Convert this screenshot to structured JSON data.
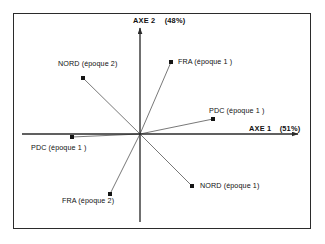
{
  "chart_data": {
    "type": "scatter",
    "title": "",
    "subtitle": "",
    "xlabel": "AXE 1",
    "ylabel": "AXE 2",
    "xlabel_full": "AXE 1  (51%)",
    "ylabel_full": "AXE 2   (48%)",
    "x_variance_pct": "(51%)",
    "y_variance_pct": "(48%)",
    "grid": false,
    "legend": "none",
    "origin": {
      "x": 140,
      "y": 134
    },
    "xlim": [
      -1.0,
      1.0
    ],
    "ylim": [
      -1.0,
      1.0
    ],
    "points": [
      {
        "name": "NORD-epoque-2",
        "label": "NORD (époque 2)",
        "px": 83,
        "py": 78,
        "label_x": 58,
        "label_y": 59,
        "connector": true
      },
      {
        "name": "FRA-epoque-1",
        "label": "FRA  (époque 1 )",
        "px": 171,
        "py": 62,
        "label_x": 178,
        "label_y": 57,
        "connector": true
      },
      {
        "name": "PDC-epoque-1-right",
        "label": "PDC (époque 1 )",
        "px": 213,
        "py": 119,
        "label_x": 209,
        "label_y": 106,
        "connector": true
      },
      {
        "name": "PDC-epoque-1-left",
        "label": "PDC (époque 1 )",
        "px": 72,
        "py": 137,
        "label_x": 31,
        "label_y": 143,
        "connector": true
      },
      {
        "name": "NORD-epoque-1",
        "label": "NORD (époque 1)",
        "px": 192,
        "py": 186,
        "label_x": 200,
        "label_y": 181,
        "connector": true
      },
      {
        "name": "FRA-epoque-2",
        "label": "FRA (époque 2)",
        "px": 110,
        "py": 194,
        "label_x": 62,
        "label_y": 196,
        "connector": true
      }
    ],
    "axes": {
      "x_axis_left_x": 22,
      "x_axis_right_x": 298,
      "x_axis_y": 134,
      "y_axis_top_y": 28,
      "y_axis_bottom_y": 222,
      "y_axis_x": 140
    },
    "colors": {
      "line": "#2b2b2b",
      "marker": "#151515",
      "connector": "#3d3d3d",
      "frame": "#2b2b2b",
      "text": "#111111",
      "background": "#ffffff"
    }
  }
}
